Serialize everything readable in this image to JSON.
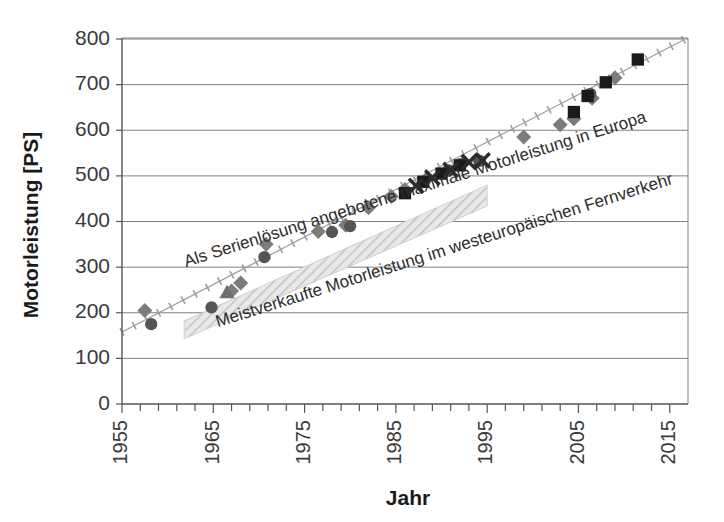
{
  "chart_data": {
    "type": "scatter",
    "title": "",
    "xlabel": "Jahr",
    "ylabel": "Motorleistung [PS]",
    "xlim": [
      1955,
      2017
    ],
    "ylim": [
      0,
      800
    ],
    "grid": true,
    "legend_position": "none",
    "xticks": [
      1955,
      1965,
      1975,
      1985,
      1995,
      2005,
      2015
    ],
    "xtick_labels": [
      "1955",
      "1965",
      "1975",
      "1985",
      "1995",
      "2005",
      "2015"
    ],
    "xminor_step": 2,
    "yticks": [
      0,
      100,
      200,
      300,
      400,
      500,
      600,
      700,
      800
    ],
    "ytick_labels": [
      "0",
      "100",
      "200",
      "300",
      "400",
      "500",
      "600",
      "700",
      "800"
    ],
    "annotations": [
      {
        "name": "upper-trend-label",
        "text": "Als Serienlösung angebotene maximale Motorleistung in Europa",
        "x": 1962.0,
        "y": 300,
        "rotation": -17.5
      },
      {
        "name": "lower-band-label",
        "text": "Meistverkaufte Motorleistung im westeuropäischen Fernverkehr",
        "x": 1965.5,
        "y": 168,
        "rotation": -17.5
      }
    ],
    "series": [
      {
        "name": "Maximale Motorleistung (Trendlinie)",
        "marker": "dotted-cross-line",
        "color": "#9b9b9b",
        "type": "line",
        "points": [
          {
            "x": 1955.0,
            "y": 158
          },
          {
            "x": 2016.5,
            "y": 798
          }
        ]
      },
      {
        "name": "Meistverkaufte Motorleistung (Band)",
        "marker": "hatched-band",
        "color": "#d8d8d8",
        "type": "area",
        "band": {
          "x_start": 1961.8,
          "x_end": 1995.0,
          "y_start_low": 143,
          "y_start_high": 182,
          "y_end_low": 434,
          "y_end_high": 480
        }
      },
      {
        "name": "Hersteller A (Raute)",
        "marker": "diamond",
        "color": "#7c7c7c",
        "points": [
          {
            "x": 1957.5,
            "y": 205
          },
          {
            "x": 1967.0,
            "y": 248
          },
          {
            "x": 1968.0,
            "y": 265
          },
          {
            "x": 1970.8,
            "y": 350
          },
          {
            "x": 1976.5,
            "y": 378
          },
          {
            "x": 1979.5,
            "y": 392
          },
          {
            "x": 1982.0,
            "y": 430
          },
          {
            "x": 1984.5,
            "y": 455
          },
          {
            "x": 1986.0,
            "y": 470
          },
          {
            "x": 1988.3,
            "y": 492
          },
          {
            "x": 1990.5,
            "y": 510
          },
          {
            "x": 1992.5,
            "y": 530
          },
          {
            "x": 1994.0,
            "y": 535
          },
          {
            "x": 1999.0,
            "y": 585
          },
          {
            "x": 2003.0,
            "y": 612
          },
          {
            "x": 2004.5,
            "y": 625
          },
          {
            "x": 2006.5,
            "y": 670
          },
          {
            "x": 2009.0,
            "y": 715
          }
        ]
      },
      {
        "name": "Hersteller B (Kreis)",
        "marker": "circle",
        "color": "#555555",
        "points": [
          {
            "x": 1958.2,
            "y": 175
          },
          {
            "x": 1964.8,
            "y": 212
          },
          {
            "x": 1970.6,
            "y": 322
          },
          {
            "x": 1978.0,
            "y": 377
          },
          {
            "x": 1980.0,
            "y": 390
          },
          {
            "x": 1986.0,
            "y": 463
          },
          {
            "x": 1990.8,
            "y": 512
          },
          {
            "x": 1992.0,
            "y": 525
          },
          {
            "x": 1994.2,
            "y": 533
          },
          {
            "x": 2006.3,
            "y": 680
          }
        ]
      },
      {
        "name": "Hersteller C (Dreieck)",
        "marker": "triangle",
        "color": "#6e6e6e",
        "points": [
          {
            "x": 1966.5,
            "y": 245
          }
        ]
      },
      {
        "name": "Hersteller D (Quadrat)",
        "marker": "square",
        "color": "#1a1a1a",
        "points": [
          {
            "x": 1986.0,
            "y": 462
          },
          {
            "x": 1988.0,
            "y": 487
          },
          {
            "x": 1990.0,
            "y": 505
          },
          {
            "x": 1992.0,
            "y": 523
          },
          {
            "x": 2004.5,
            "y": 640
          },
          {
            "x": 2006.0,
            "y": 675
          },
          {
            "x": 2008.0,
            "y": 705
          },
          {
            "x": 2011.5,
            "y": 755
          }
        ]
      },
      {
        "name": "Hersteller E (Kreuz)",
        "marker": "x-cross",
        "color": "#2b2b2b",
        "points": [
          {
            "x": 1987.2,
            "y": 478
          },
          {
            "x": 1989.0,
            "y": 496
          },
          {
            "x": 1991.0,
            "y": 513
          },
          {
            "x": 1993.0,
            "y": 530
          },
          {
            "x": 1994.5,
            "y": 534
          }
        ]
      }
    ]
  },
  "plot": {
    "left_px": 122,
    "right_px": 688,
    "top_px": 39,
    "bottom_px": 404
  }
}
